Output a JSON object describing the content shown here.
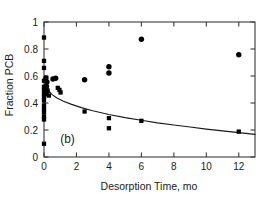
{
  "figure": {
    "panel_label": "(b)",
    "background_color": "#ffffff",
    "frame_color": "#3a3a3a",
    "marker_color": "#000000",
    "curve_color": "#1a1a1a"
  },
  "chart_data": {
    "type": "scatter",
    "title": "",
    "xlabel": "Desorption Time, mo",
    "ylabel": "Fraction PCB",
    "xlim": [
      0,
      13
    ],
    "ylim": [
      0,
      1
    ],
    "xticks": [
      0,
      2,
      4,
      6,
      8,
      10,
      12
    ],
    "xtick_labels": [
      "0",
      "2",
      "4",
      "6",
      "8",
      "10",
      "12"
    ],
    "yticks": [
      0,
      0.2,
      0.4,
      0.6,
      0.8,
      1
    ],
    "ytick_labels": [
      "0",
      "0.2",
      "0.4",
      "0.6",
      "0.8",
      "1"
    ],
    "grid": false,
    "legend": "none",
    "annotations": [
      {
        "text": "(b)",
        "x": 1.45,
        "y": 0.105
      }
    ],
    "series": [
      {
        "name": "circles",
        "marker": "circle",
        "color": "#000000",
        "points": [
          {
            "x": 0.12,
            "y": 0.585
          },
          {
            "x": 0.18,
            "y": 0.555
          },
          {
            "x": 0.15,
            "y": 0.525
          },
          {
            "x": 0.13,
            "y": 0.505
          },
          {
            "x": 0.17,
            "y": 0.487
          },
          {
            "x": 0.12,
            "y": 0.468
          },
          {
            "x": 0.55,
            "y": 0.578
          },
          {
            "x": 0.72,
            "y": 0.583
          },
          {
            "x": 2.5,
            "y": 0.572
          },
          {
            "x": 4.0,
            "y": 0.668
          },
          {
            "x": 4.0,
            "y": 0.622
          },
          {
            "x": 6.0,
            "y": 0.872
          },
          {
            "x": 12.0,
            "y": 0.757
          }
        ]
      },
      {
        "name": "squares",
        "marker": "square",
        "color": "#000000",
        "points": [
          {
            "x": 0.0,
            "y": 0.885
          },
          {
            "x": 0.0,
            "y": 0.712
          },
          {
            "x": 0.0,
            "y": 0.66
          },
          {
            "x": 0.0,
            "y": 0.565
          },
          {
            "x": 0.0,
            "y": 0.52
          },
          {
            "x": 0.0,
            "y": 0.498
          },
          {
            "x": 0.0,
            "y": 0.47
          },
          {
            "x": 0.0,
            "y": 0.445
          },
          {
            "x": 0.0,
            "y": 0.418
          },
          {
            "x": 0.0,
            "y": 0.382
          },
          {
            "x": 0.0,
            "y": 0.355
          },
          {
            "x": 0.0,
            "y": 0.33
          },
          {
            "x": 0.0,
            "y": 0.3
          },
          {
            "x": 0.0,
            "y": 0.278
          },
          {
            "x": 0.0,
            "y": 0.098
          },
          {
            "x": 0.22,
            "y": 0.492
          },
          {
            "x": 0.3,
            "y": 0.455
          },
          {
            "x": 0.85,
            "y": 0.512
          },
          {
            "x": 0.95,
            "y": 0.497
          },
          {
            "x": 1.02,
            "y": 0.478
          },
          {
            "x": 2.5,
            "y": 0.337
          },
          {
            "x": 4.0,
            "y": 0.288
          },
          {
            "x": 4.0,
            "y": 0.213
          },
          {
            "x": 6.0,
            "y": 0.268
          },
          {
            "x": 12.0,
            "y": 0.188
          }
        ]
      }
    ],
    "fit_curve": {
      "name": "model-fit",
      "color": "#1a1a1a",
      "points": [
        {
          "x": 0.3,
          "y": 0.487
        },
        {
          "x": 0.5,
          "y": 0.462
        },
        {
          "x": 0.8,
          "y": 0.437
        },
        {
          "x": 1.2,
          "y": 0.413
        },
        {
          "x": 1.7,
          "y": 0.39
        },
        {
          "x": 2.3,
          "y": 0.366
        },
        {
          "x": 3.0,
          "y": 0.343
        },
        {
          "x": 4.0,
          "y": 0.315
        },
        {
          "x": 5.0,
          "y": 0.292
        },
        {
          "x": 6.0,
          "y": 0.272
        },
        {
          "x": 7.0,
          "y": 0.253
        },
        {
          "x": 8.0,
          "y": 0.237
        },
        {
          "x": 9.0,
          "y": 0.222
        },
        {
          "x": 10.0,
          "y": 0.207
        },
        {
          "x": 11.0,
          "y": 0.194
        },
        {
          "x": 12.0,
          "y": 0.181
        },
        {
          "x": 13.0,
          "y": 0.168
        }
      ]
    }
  }
}
